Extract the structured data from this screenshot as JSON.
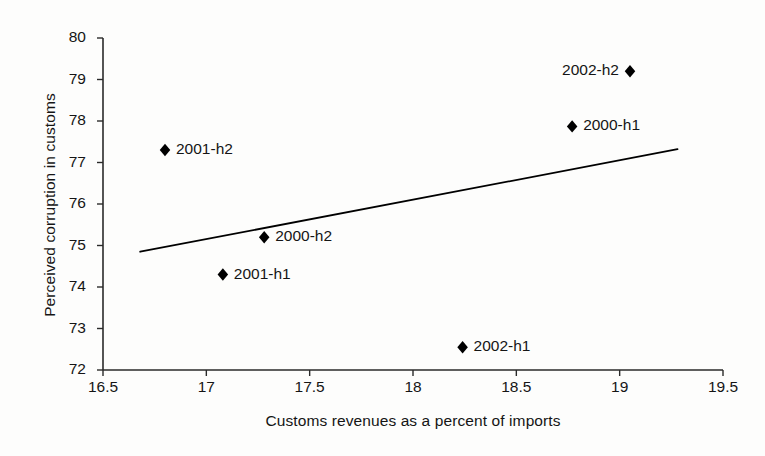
{
  "chart_data": {
    "type": "scatter",
    "title": "",
    "xlabel": "Customs revenues as a percent of imports",
    "ylabel": "Perceived corruption in customs",
    "xlim": [
      16.5,
      19.5
    ],
    "ylim": [
      72,
      80
    ],
    "xticks": [
      "16.5",
      "17",
      "17.5",
      "18",
      "18.5",
      "19",
      "19.5"
    ],
    "xtick_values": [
      16.5,
      17,
      17.5,
      18,
      18.5,
      19,
      19.5
    ],
    "yticks": [
      "72",
      "73",
      "74",
      "75",
      "76",
      "77",
      "78",
      "79",
      "80"
    ],
    "ytick_values": [
      72,
      73,
      74,
      75,
      76,
      77,
      78,
      79,
      80
    ],
    "grid": false,
    "legend": "none",
    "marker": "filled-diamond",
    "marker_color": "#000000",
    "points": [
      {
        "label": "2001-h2",
        "x": 16.8,
        "y": 77.3,
        "label_side": "right"
      },
      {
        "label": "2001-h1",
        "x": 17.08,
        "y": 74.3,
        "label_side": "right"
      },
      {
        "label": "2000-h2",
        "x": 17.28,
        "y": 75.2,
        "label_side": "right"
      },
      {
        "label": "2002-h1",
        "x": 18.24,
        "y": 72.55,
        "label_side": "right"
      },
      {
        "label": "2000-h1",
        "x": 18.77,
        "y": 77.87,
        "label_side": "right"
      },
      {
        "label": "2002-h2",
        "x": 19.05,
        "y": 79.2,
        "label_side": "left"
      }
    ],
    "trendline": {
      "type": "linear",
      "x_start": 16.68,
      "y_start": 74.85,
      "x_end": 19.28,
      "y_end": 77.32,
      "color": "#000000"
    }
  }
}
